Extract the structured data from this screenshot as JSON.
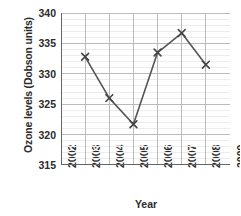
{
  "chart_data": {
    "type": "line",
    "title": "",
    "xlabel": "Year",
    "ylabel": "Ozone levels (Dobson units)",
    "x": [
      2003,
      2004,
      2005,
      2006,
      2007,
      2008
    ],
    "values": [
      332.8,
      326.0,
      321.7,
      333.5,
      336.7,
      331.5
    ],
    "series": [
      {
        "name": "Ozone levels",
        "x": [
          2003,
          2004,
          2005,
          2006,
          2007,
          2008
        ],
        "values": [
          332.8,
          326.0,
          321.7,
          333.5,
          336.7,
          331.5
        ]
      }
    ],
    "xlim": [
      2002,
      2009
    ],
    "ylim": [
      315,
      340
    ],
    "xticks": [
      2002,
      2003,
      2004,
      2005,
      2006,
      2007,
      2008,
      2009
    ],
    "xtick_labels": [
      "2002",
      "2003",
      "2004",
      "2005",
      "2006",
      "2007",
      "2008",
      "2009"
    ],
    "yticks": [
      315,
      320,
      325,
      330,
      335,
      340
    ],
    "ytick_labels": [
      "315",
      "320",
      "325",
      "330",
      "335",
      "340"
    ],
    "y_minor_step": 1,
    "grid": true,
    "grid_major_color": "#bbbbbb",
    "grid_minor_color": "#ececec",
    "legend": false,
    "marker": "x",
    "line_color": "#555555",
    "marker_color": "#444444",
    "axis_color": "#666666"
  },
  "axes": {
    "y_title": "Ozone levels (Dobson units)",
    "x_title": "Year"
  }
}
